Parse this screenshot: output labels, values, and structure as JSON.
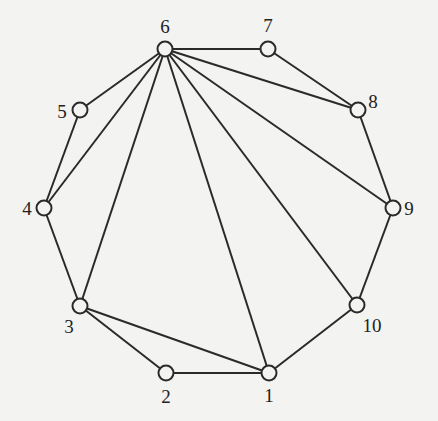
{
  "graph": {
    "nodes": [
      {
        "id": "1",
        "x": 269,
        "y": 373,
        "lx": 269,
        "ly": 402
      },
      {
        "id": "2",
        "x": 166,
        "y": 373,
        "lx": 166,
        "ly": 403
      },
      {
        "id": "3",
        "x": 80,
        "y": 306,
        "lx": 69,
        "ly": 333
      },
      {
        "id": "4",
        "x": 44,
        "y": 208,
        "lx": 27,
        "ly": 215
      },
      {
        "id": "5",
        "x": 80,
        "y": 110,
        "lx": 62,
        "ly": 118
      },
      {
        "id": "6",
        "x": 165,
        "y": 49,
        "lx": 165,
        "ly": 33
      },
      {
        "id": "7",
        "x": 268,
        "y": 49,
        "lx": 268,
        "ly": 32
      },
      {
        "id": "8",
        "x": 358,
        "y": 110,
        "lx": 373,
        "ly": 108
      },
      {
        "id": "9",
        "x": 393,
        "y": 208,
        "lx": 409,
        "ly": 215
      },
      {
        "id": "10",
        "x": 357,
        "y": 305,
        "lx": 372,
        "ly": 332
      }
    ],
    "edges": [
      [
        "1",
        "2"
      ],
      [
        "2",
        "3"
      ],
      [
        "3",
        "4"
      ],
      [
        "4",
        "5"
      ],
      [
        "5",
        "6"
      ],
      [
        "6",
        "7"
      ],
      [
        "7",
        "8"
      ],
      [
        "8",
        "9"
      ],
      [
        "9",
        "10"
      ],
      [
        "10",
        "1"
      ],
      [
        "6",
        "4"
      ],
      [
        "6",
        "3"
      ],
      [
        "6",
        "1"
      ],
      [
        "6",
        "10"
      ],
      [
        "6",
        "9"
      ],
      [
        "6",
        "8"
      ],
      [
        "3",
        "1"
      ]
    ]
  }
}
